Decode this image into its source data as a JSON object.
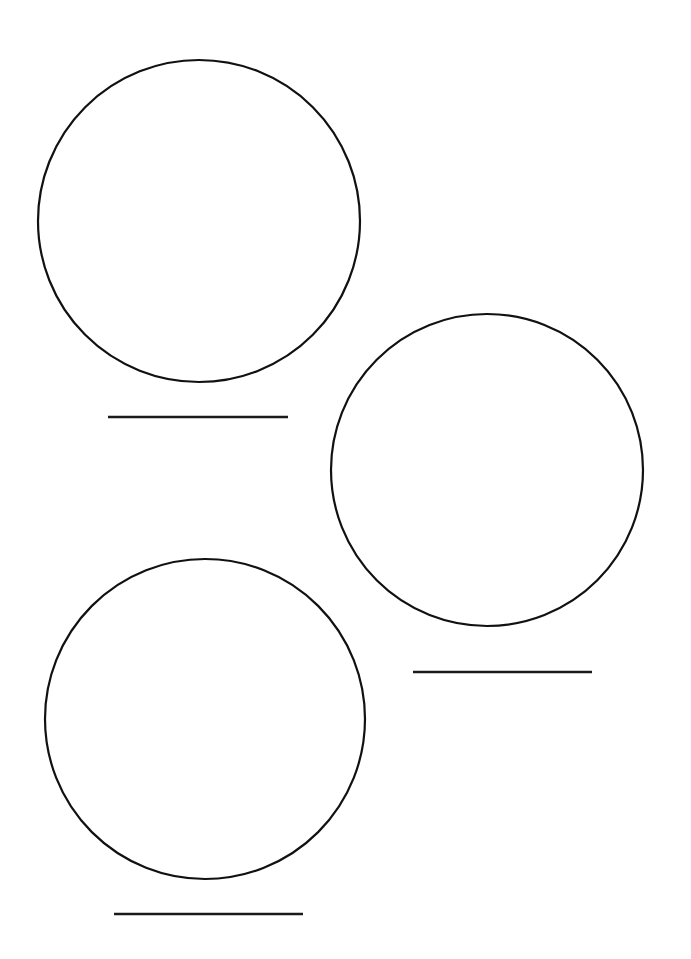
{
  "page": {
    "width": 691,
    "height": 959,
    "background_color": "#ffffff",
    "ink_color": "#111111"
  },
  "style": {
    "circle_stroke_color": "#111111",
    "circle_stroke_width": 2.2,
    "circle_fill": "none",
    "line_stroke_color": "#1a1a1a",
    "line_stroke_width": 2.4
  },
  "shapes": {
    "circles": [
      {
        "name": "circle-top-left",
        "label": "Circle 1",
        "cx": 199,
        "cy": 221,
        "r": 161
      },
      {
        "name": "circle-middle-right",
        "label": "Circle 2",
        "cx": 487,
        "cy": 470,
        "r": 156
      },
      {
        "name": "circle-bottom-left",
        "label": "Circle 3",
        "cx": 205,
        "cy": 719,
        "r": 160
      }
    ],
    "write_lines": [
      {
        "name": "write-line-1",
        "label": "Answer line 1",
        "x1": 108,
        "y1": 417,
        "x2": 288,
        "y2": 417,
        "value": ""
      },
      {
        "name": "write-line-2",
        "label": "Answer line 2",
        "x1": 413,
        "y1": 672,
        "x2": 592,
        "y2": 672,
        "value": ""
      },
      {
        "name": "write-line-3",
        "label": "Answer line 3",
        "x1": 114,
        "y1": 914,
        "x2": 303,
        "y2": 914,
        "value": ""
      }
    ]
  }
}
